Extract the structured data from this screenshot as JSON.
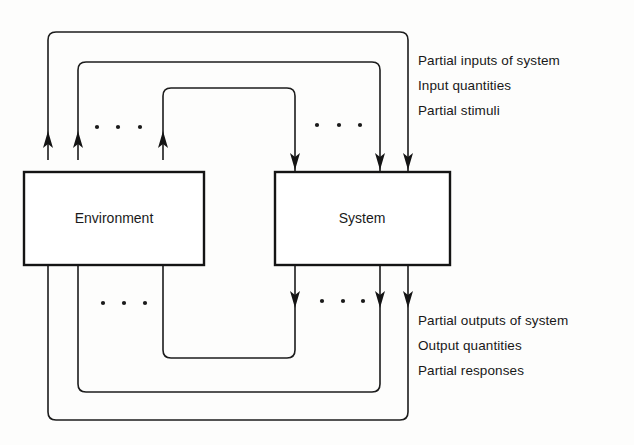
{
  "diagram": {
    "background_color": "#fdfdfc",
    "line_color": "#1c1c1c",
    "boxes": [
      {
        "id": "environment",
        "label": "Environment",
        "x": 24,
        "y": 172,
        "width": 180,
        "height": 93
      },
      {
        "id": "system",
        "label": "System",
        "x": 275,
        "y": 172,
        "width": 175,
        "height": 93
      }
    ],
    "annotations": {
      "inputs": {
        "lines": [
          "Partial inputs of system",
          "Input quantities",
          "Partial stimuli"
        ]
      },
      "outputs": {
        "lines": [
          "Partial outputs of system",
          "Output quantities",
          "Partial responses"
        ]
      }
    },
    "ellipsis_groups": [
      {
        "id": "env-top-dots",
        "label": "...",
        "cx": [
          97,
          118,
          140
        ],
        "cy": 127
      },
      {
        "id": "sys-top-dots",
        "label": "...",
        "cx": [
          317,
          339,
          360
        ],
        "cy": 125
      },
      {
        "id": "env-bottom-dots",
        "label": "...",
        "cx": [
          103,
          124,
          145
        ],
        "cy": 303
      },
      {
        "id": "sys-bottom-dots",
        "label": "...",
        "cx": [
          322,
          343,
          363
        ],
        "cy": 301
      }
    ],
    "flows": {
      "inputs_to_system_count": 3,
      "outputs_to_environment_count": 3,
      "input_arrow_x": [
        295,
        380,
        408
      ],
      "output_arrow_x": [
        295,
        380,
        408
      ],
      "environment_return_arrow_x": [
        48,
        78,
        163
      ],
      "direction_top": "down-into-system",
      "direction_bottom": "down-out-of-system"
    }
  }
}
